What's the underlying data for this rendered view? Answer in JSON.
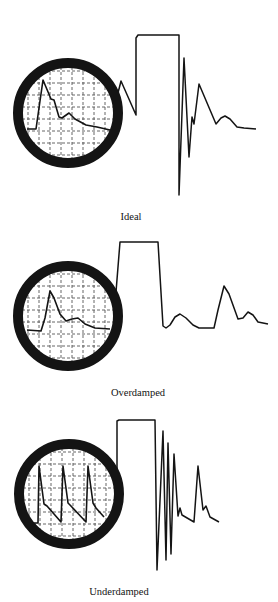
{
  "colors": {
    "background": "#ffffff",
    "line": "#141414",
    "grid": "#555555"
  },
  "panels": [
    {
      "id": "ideal",
      "label": "Ideal",
      "label_pos": [
        131,
        213
      ],
      "monitor": {
        "center": [
          68,
          113
        ],
        "radius": 46,
        "bezel_width": 10,
        "trace": [
          [
            27,
            129
          ],
          [
            36,
            129
          ],
          [
            43,
            80
          ],
          [
            51,
            99
          ],
          [
            54,
            100
          ],
          [
            59,
            117
          ],
          [
            62,
            118
          ],
          [
            69,
            113
          ],
          [
            75,
            119
          ],
          [
            86,
            125
          ],
          [
            97,
            127
          ],
          [
            110,
            130
          ]
        ]
      },
      "square_wave_trace": [
        [
          118,
          93
        ],
        [
          121,
          81
        ],
        [
          136,
          115
        ],
        [
          136,
          38
        ],
        [
          138,
          35
        ],
        [
          142,
          35
        ],
        [
          179,
          35
        ],
        [
          179,
          195
        ],
        [
          184,
          58
        ],
        [
          189,
          157
        ],
        [
          192,
          117
        ],
        [
          194,
          124
        ],
        [
          199,
          84
        ],
        [
          216,
          124
        ],
        [
          221,
          118
        ],
        [
          225,
          116
        ],
        [
          230,
          119
        ],
        [
          237,
          127
        ],
        [
          244,
          128
        ],
        [
          256,
          129
        ]
      ]
    },
    {
      "id": "overdamped",
      "label": "Overdamped",
      "label_pos": [
        138,
        389
      ],
      "monitor": {
        "center": [
          68,
          316
        ],
        "radius": 46,
        "bezel_width": 10,
        "trace": [
          [
            27,
            330
          ],
          [
            41,
            331
          ],
          [
            45,
            318
          ],
          [
            50,
            291
          ],
          [
            54,
            298
          ],
          [
            60,
            314
          ],
          [
            66,
            321
          ],
          [
            72,
            319
          ],
          [
            78,
            318
          ],
          [
            85,
            324
          ],
          [
            95,
            328
          ],
          [
            110,
            329
          ]
        ]
      },
      "square_wave_trace": [
        [
          116,
          292
        ],
        [
          120,
          242
        ],
        [
          158,
          242
        ],
        [
          163,
          326
        ],
        [
          166,
          328
        ],
        [
          170,
          325
        ],
        [
          175,
          317
        ],
        [
          180,
          314
        ],
        [
          186,
          318
        ],
        [
          193,
          325
        ],
        [
          199,
          328
        ],
        [
          214,
          328
        ],
        [
          218,
          310
        ],
        [
          224,
          286
        ],
        [
          229,
          294
        ],
        [
          238,
          319
        ],
        [
          243,
          318
        ],
        [
          248,
          312
        ],
        [
          253,
          315
        ],
        [
          258,
          322
        ],
        [
          268,
          324
        ]
      ]
    },
    {
      "id": "underdamped",
      "label": "Underdamped",
      "label_pos": [
        119,
        588
      ],
      "monitor": {
        "center": [
          69,
          494
        ],
        "radius": 46,
        "bezel_width": 10,
        "trace": [
          [
            30,
            523
          ],
          [
            38,
            523
          ],
          [
            39,
            466
          ],
          [
            44,
            504
          ],
          [
            47,
            506
          ],
          [
            61,
            522
          ],
          [
            63,
            466
          ],
          [
            68,
            503
          ],
          [
            70,
            505
          ],
          [
            86,
            522
          ],
          [
            88,
            466
          ],
          [
            93,
            503
          ],
          [
            96,
            508
          ],
          [
            104,
            517
          ]
        ]
      },
      "square_wave_trace": [
        [
          117,
          475
        ],
        [
          117,
          421
        ],
        [
          119,
          420
        ],
        [
          122,
          420
        ],
        [
          155,
          420
        ],
        [
          157,
          570
        ],
        [
          163,
          431
        ],
        [
          166,
          560
        ],
        [
          168,
          443
        ],
        [
          171,
          554
        ],
        [
          174,
          454
        ],
        [
          178,
          516
        ],
        [
          180,
          508
        ],
        [
          182,
          515
        ],
        [
          194,
          522
        ],
        [
          198,
          466
        ],
        [
          203,
          510
        ],
        [
          206,
          506
        ],
        [
          210,
          517
        ],
        [
          219,
          522
        ]
      ]
    }
  ]
}
